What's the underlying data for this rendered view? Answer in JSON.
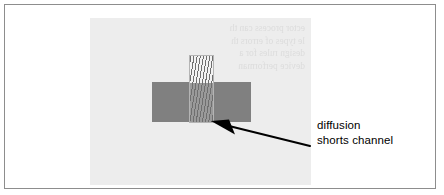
{
  "figure": {
    "background_color": "#ffffff",
    "border_color": "#8d8d8d",
    "panel": {
      "background_color": "#ededed",
      "showthrough_text": "ector process can th\nle types of errors th\ndesign rules for a\ndevice performan"
    },
    "shapes": {
      "channel_bar": {
        "name": "channel",
        "color": "#808080"
      },
      "diffusion_stripe": {
        "name": "diffusion",
        "fill_color": "#f3f3f3",
        "hatch_color": "#6f6f6f",
        "outline_color": "#b4b4b4"
      }
    },
    "annotation": {
      "arrow_color": "#000000",
      "caption_line_1": "diffusion",
      "caption_line_2": "shorts channel"
    }
  }
}
